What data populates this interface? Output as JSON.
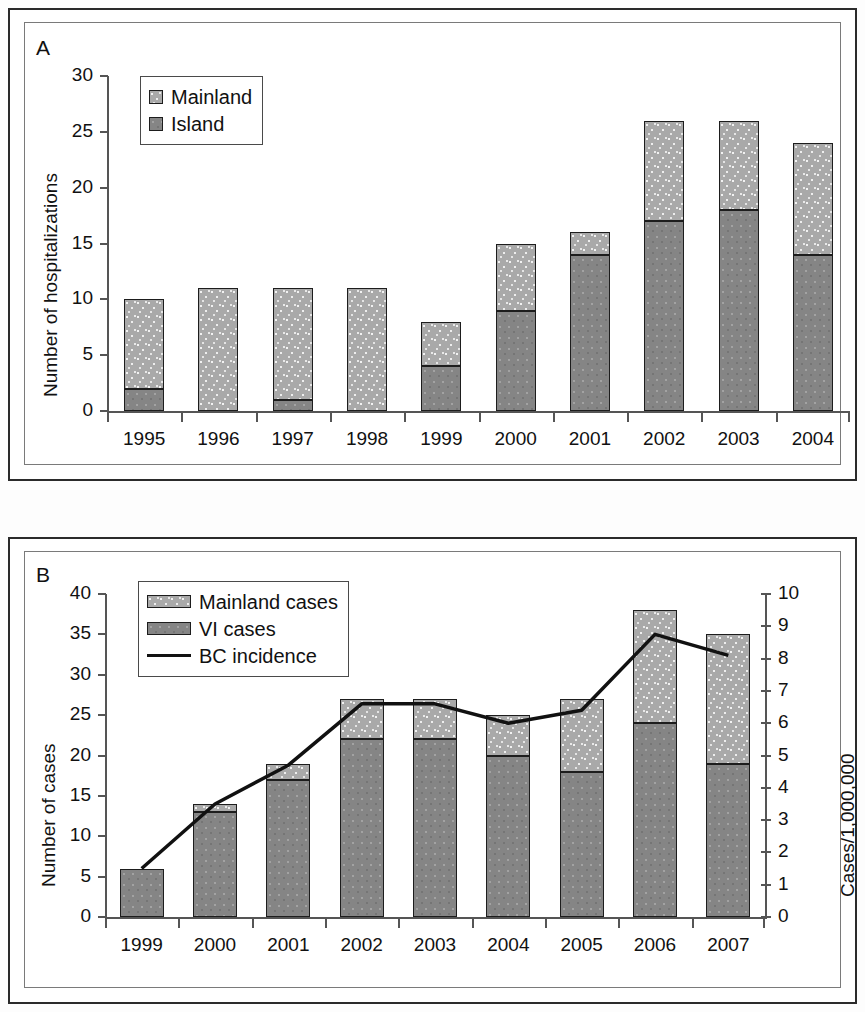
{
  "figure": {
    "panel_a_letter": "A",
    "panel_b_letter": "B"
  },
  "chart_data": [
    {
      "panel": "A",
      "type": "bar",
      "stacked": true,
      "title": "",
      "xlabel": "",
      "ylabel": "Number of hospitalizations",
      "ylim": [
        0,
        30
      ],
      "yticks": [
        0,
        5,
        10,
        15,
        20,
        25,
        30
      ],
      "ytick_labels": [
        "0",
        "5",
        "10",
        "15",
        "20",
        "25",
        "30"
      ],
      "grid": false,
      "legend_position": "upper-left-inside",
      "categories": [
        "1995",
        "1996",
        "1997",
        "1998",
        "1999",
        "2000",
        "2001",
        "2002",
        "2003",
        "2004"
      ],
      "series": [
        {
          "name": "Island",
          "legend_label": "Island",
          "fill": "dark",
          "color": "#858585",
          "values": [
            2,
            0,
            1,
            0,
            4,
            9,
            14,
            17,
            18,
            14
          ]
        },
        {
          "name": "Mainland",
          "legend_label": "Mainland",
          "fill": "light",
          "color": "#a9a9a9",
          "values": [
            8,
            11,
            10,
            11,
            4,
            6,
            2,
            9,
            8,
            10
          ]
        }
      ],
      "totals": [
        10,
        11,
        11,
        11,
        8,
        15,
        16,
        26,
        26,
        24
      ],
      "legend_order": [
        "Mainland",
        "Island"
      ]
    },
    {
      "panel": "B",
      "type": "bar",
      "stacked": true,
      "title": "",
      "xlabel": "",
      "ylabel": "Number of cases",
      "ylabel_right": "Cases/1,000,000",
      "ylim": [
        0,
        40
      ],
      "yticks": [
        0,
        5,
        10,
        15,
        20,
        25,
        30,
        35,
        40
      ],
      "ytick_labels": [
        "0",
        "5",
        "10",
        "15",
        "20",
        "25",
        "30",
        "35",
        "40"
      ],
      "ylim_right": [
        0,
        10
      ],
      "yticks_right": [
        0,
        1,
        2,
        3,
        4,
        5,
        6,
        7,
        8,
        9,
        10
      ],
      "ytick_labels_right": [
        "0",
        "1",
        "2",
        "3",
        "4",
        "5",
        "6",
        "7",
        "8",
        "9",
        "10"
      ],
      "grid": false,
      "legend_position": "upper-left-inside",
      "categories": [
        "1999",
        "2000",
        "2001",
        "2002",
        "2003",
        "2004",
        "2005",
        "2006",
        "2007"
      ],
      "series": [
        {
          "name": "VI cases",
          "legend_label": "VI cases",
          "fill": "dark",
          "color": "#858585",
          "values": [
            6,
            13,
            17,
            22,
            22,
            20,
            18,
            24,
            19
          ]
        },
        {
          "name": "Mainland cases",
          "legend_label": "Mainland cases",
          "fill": "light",
          "color": "#a9a9a9",
          "values": [
            0,
            1,
            2,
            5,
            5,
            5,
            9,
            14,
            16
          ]
        },
        {
          "name": "BC incidence",
          "legend_label": "BC incidence",
          "fill": "line",
          "color": "#111111",
          "axis": "right",
          "values": [
            1.5,
            3.5,
            4.7,
            6.6,
            6.6,
            6.0,
            6.4,
            8.75,
            8.1
          ]
        }
      ],
      "totals": [
        6,
        14,
        19,
        27,
        27,
        25,
        27,
        38,
        35
      ],
      "legend_order": [
        "Mainland cases",
        "VI cases",
        "BC incidence"
      ]
    }
  ]
}
